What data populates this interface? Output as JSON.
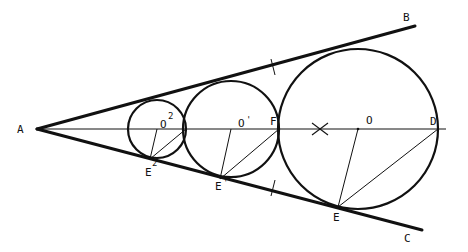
{
  "diagram": {
    "type": "geometric-construction",
    "colors": {
      "stroke": "#111111",
      "background": "#ffffff"
    },
    "points": {
      "A": {
        "label": "A",
        "x": 37,
        "y": 129
      },
      "B": {
        "label": "B",
        "x": 415,
        "y": 26
      },
      "C": {
        "label": "C",
        "x": 422,
        "y": 230
      },
      "D": {
        "label": "D",
        "x": 438,
        "y": 129
      },
      "F": {
        "label": "F",
        "x": 279,
        "y": 129
      },
      "O": {
        "label": "O",
        "x": 358,
        "y": 129
      },
      "O1": {
        "label": "O",
        "sup": "'",
        "x": 231,
        "y": 129
      },
      "O2": {
        "label": "O",
        "sup": "2",
        "x": 157,
        "y": 129
      },
      "E": {
        "label": "E",
        "x": 338,
        "y": 207
      },
      "E1": {
        "label": "E",
        "sup": "'",
        "x": 220,
        "y": 179
      },
      "E2": {
        "label": "E",
        "sup": "2",
        "x": 150,
        "y": 159
      }
    },
    "circles": [
      {
        "name": "large",
        "center": "O",
        "cx": 358,
        "cy": 129,
        "r": 80
      },
      {
        "name": "medium",
        "center": "O'",
        "cx": 231,
        "cy": 129,
        "r": 48
      },
      {
        "name": "small",
        "center": "O2",
        "cx": 157,
        "cy": 129,
        "r": 29
      }
    ],
    "marks": {
      "cross": {
        "x": 320,
        "y": 129
      },
      "tick_top": {
        "x": 273,
        "y": 67
      },
      "tick_bottom": {
        "x": 273,
        "y": 188
      }
    },
    "labels": {
      "A": "A",
      "B": "B",
      "C": "C",
      "D": "D",
      "F": "F",
      "O": "O",
      "O1": "O",
      "O1_sup": "'",
      "O2": "O",
      "O2_sup": "2",
      "E": "E",
      "E1": "E",
      "E1_sup": "'",
      "E2": "E",
      "E2_sup": "2"
    }
  }
}
